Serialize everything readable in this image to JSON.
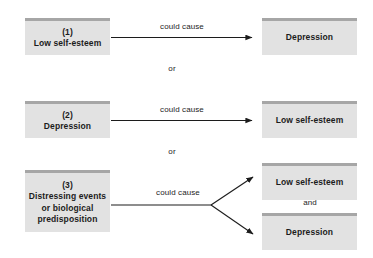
{
  "diagram": {
    "type": "flow-diagram",
    "background_color": "#ffffff",
    "box_fill_color": "#e2e2e2",
    "box_top_bar_color": "#a6a6a6",
    "arrow_color": "#1c1c1c",
    "rows": [
      {
        "id": "row-1",
        "source_number": "(1)",
        "source_label": "Low self-esteem",
        "edge_label": "could cause",
        "target_labels": [
          "Depression"
        ]
      },
      {
        "id": "row-2",
        "source_number": "(2)",
        "source_label": "Depression",
        "edge_label": "could cause",
        "target_labels": [
          "Low self-esteem"
        ]
      },
      {
        "id": "row-3",
        "source_number": "(3)",
        "source_label": "Distressing events or biological predisposition",
        "source_line1": "Distressing events",
        "source_line2": "or biological",
        "source_line3": "predisposition",
        "edge_label": "could cause",
        "target_labels": [
          "Low self-esteem",
          "Depression"
        ],
        "target_connector": "and"
      }
    ],
    "connectors": [
      {
        "id": "connector-1",
        "label": "or"
      },
      {
        "id": "connector-2",
        "label": "or"
      }
    ]
  }
}
